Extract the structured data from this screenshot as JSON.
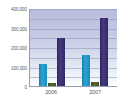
{
  "chart_data": {
    "type": "bar",
    "title": "",
    "subtitle": "",
    "xlabel": "",
    "ylabel": "",
    "categories": [
      "2006",
      "2007"
    ],
    "series": [
      {
        "name": "Series 1",
        "color": "#1d8cbb",
        "values": [
          115000,
          160000
        ]
      },
      {
        "name": "Series 2",
        "color": "#465c22",
        "values": [
          15000,
          20000
        ]
      },
      {
        "name": "Series 3",
        "color": "#332869",
        "values": [
          250000,
          355000
        ]
      }
    ],
    "ylim": [
      0,
      400000
    ],
    "yticks": [
      0,
      100000,
      200000,
      300000,
      400000
    ],
    "ytick_labels": [
      "0",
      "100,000",
      "200,000",
      "300,000",
      "400,000"
    ],
    "grid": true,
    "legend": "none",
    "plot_background_top_color": "#b7bcdc",
    "plot_background_bottom_color": "#ffffff",
    "axis_color": "#9a9ab0",
    "tick_label_color": "#58585a"
  }
}
